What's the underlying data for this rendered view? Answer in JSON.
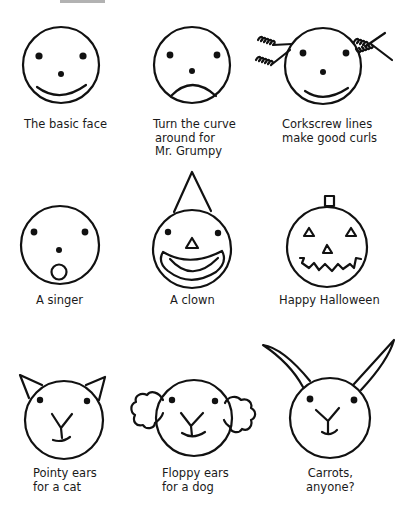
{
  "faces": [
    {
      "id": "basic",
      "label_lines": [
        "The basic face"
      ]
    },
    {
      "id": "grumpy",
      "label_lines": [
        "Turn the curve",
        "around for",
        "Mr. Grumpy"
      ]
    },
    {
      "id": "curls",
      "label_lines": [
        "Corkscrew lines",
        "make good curls"
      ]
    },
    {
      "id": "singer",
      "label_lines": [
        "A singer"
      ]
    },
    {
      "id": "clown",
      "label_lines": [
        "A clown"
      ]
    },
    {
      "id": "halloween",
      "label_lines": [
        "Happy Halloween"
      ]
    },
    {
      "id": "cat",
      "label_lines": [
        "Pointy ears",
        "for a cat"
      ]
    },
    {
      "id": "dog",
      "label_lines": [
        "Floppy ears",
        "for a dog"
      ]
    },
    {
      "id": "rabbit",
      "label_lines": [
        "Carrots,",
        "anyone?"
      ]
    }
  ],
  "colors": {
    "ink": "#111111",
    "background": "#ffffff"
  }
}
